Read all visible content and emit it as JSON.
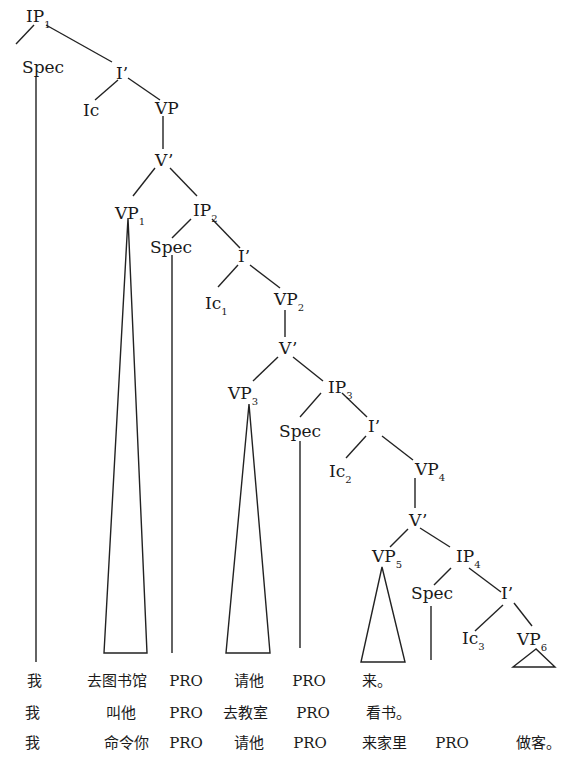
{
  "diagram": {
    "type": "syntax-tree",
    "nodes": {
      "ip1": {
        "label": "IP",
        "sub": "1"
      },
      "spec1": {
        "label": "Spec"
      },
      "ibar1": {
        "label": "I’"
      },
      "ic": {
        "label": "Ic"
      },
      "vp": {
        "label": "VP"
      },
      "vbar1": {
        "label": "V’"
      },
      "vp1": {
        "label": "VP",
        "sub": "1"
      },
      "ip2": {
        "label": "IP",
        "sub": "2"
      },
      "spec2": {
        "label": "Spec"
      },
      "ibar2": {
        "label": "I’"
      },
      "ic1": {
        "label": "Ic",
        "sub": "1"
      },
      "vp2": {
        "label": "VP",
        "sub": "2"
      },
      "vbar2": {
        "label": "V’"
      },
      "vp3": {
        "label": "VP",
        "sub": "3"
      },
      "ip3": {
        "label": "IP",
        "sub": "3"
      },
      "spec3": {
        "label": "Spec"
      },
      "ibar3": {
        "label": "I’"
      },
      "ic2": {
        "label": "Ic",
        "sub": "2"
      },
      "vp4": {
        "label": "VP",
        "sub": "4"
      },
      "vbar3": {
        "label": "V’"
      },
      "vp5": {
        "label": "VP",
        "sub": "5"
      },
      "ip4": {
        "label": "IP",
        "sub": "4"
      },
      "spec4": {
        "label": "Spec"
      },
      "ibar4": {
        "label": "I’"
      },
      "ic3": {
        "label": "Ic",
        "sub": "3"
      },
      "vp6": {
        "label": "VP",
        "sub": "6"
      }
    },
    "leaf_rows": [
      [
        "我",
        "去图书馆",
        "PRO",
        "请他",
        "PRO",
        "来。",
        "",
        ""
      ],
      [
        "我",
        "叫他",
        "PRO",
        "去教室",
        "PRO",
        "看书。",
        "",
        ""
      ],
      [
        "我",
        "命令你",
        "PRO",
        "请他",
        "PRO",
        "来家里",
        "PRO",
        "做客。"
      ]
    ]
  }
}
